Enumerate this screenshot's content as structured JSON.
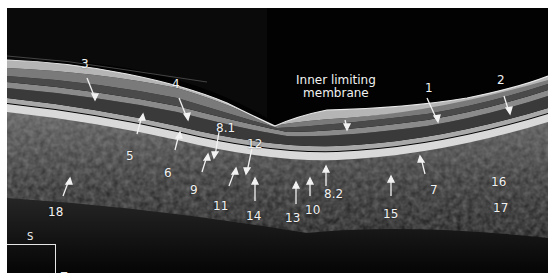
{
  "figure": {
    "type": "OCT retinal cross-section",
    "colors": {
      "background": "#020202",
      "labels": "#f2f2f2",
      "frame": "#ffffff"
    }
  },
  "labels": {
    "ilm": "Inner limiting\nmembrane",
    "ilm_line1": "Inner limiting",
    "ilm_line2": "membrane",
    "n1": "1",
    "n2": "2",
    "n3": "3",
    "n4": "4",
    "n5": "5",
    "n6": "6",
    "n7": "7",
    "n8_1": "8.1",
    "n8_2": "8.2",
    "n9": "9",
    "n10": "10",
    "n11": "11",
    "n12": "12",
    "n13": "13",
    "n14": "14",
    "n15": "15",
    "n16": "16",
    "n17": "17",
    "n18": "18"
  },
  "orientation": {
    "superior": "S",
    "temporal": "T"
  }
}
